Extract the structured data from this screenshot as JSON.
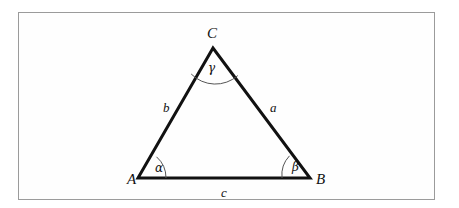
{
  "figure": {
    "type": "geometry-diagram",
    "shape": "triangle",
    "frame_color": "#9b9b9b",
    "stroke_color": "#111111",
    "background_color": "#ffffff",
    "vertices": [
      {
        "name": "A",
        "label": "A",
        "x": 138,
        "y": 178,
        "label_x": 127,
        "label_y": 172
      },
      {
        "name": "B",
        "label": "B",
        "x": 310,
        "y": 178,
        "label_x": 316,
        "label_y": 172
      },
      {
        "name": "C",
        "label": "C",
        "x": 213,
        "y": 48,
        "label_x": 207,
        "label_y": 26
      }
    ],
    "sides": [
      {
        "name": "a",
        "label": "a",
        "between": "B-C",
        "label_x": 270,
        "label_y": 101
      },
      {
        "name": "b",
        "label": "b",
        "between": "A-C",
        "label_x": 163,
        "label_y": 101
      },
      {
        "name": "c",
        "label": "c",
        "between": "A-B",
        "label_x": 221,
        "label_y": 186
      }
    ],
    "angles": [
      {
        "name": "alpha",
        "label": "α",
        "at_vertex": "A",
        "arc_radius": 28,
        "label_x": 155,
        "label_y": 162
      },
      {
        "name": "beta",
        "label": "β",
        "at_vertex": "B",
        "arc_radius": 28,
        "label_x": 292,
        "label_y": 161
      },
      {
        "name": "gamma",
        "label": "γ",
        "at_vertex": "C",
        "arc_radius": 34,
        "label_x": 208,
        "label_y": 62
      }
    ]
  }
}
